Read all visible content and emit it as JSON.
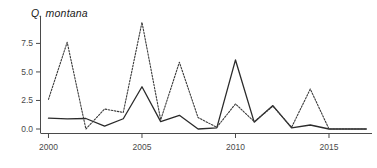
{
  "chart_data": {
    "type": "line",
    "title": "Q. montana",
    "xlabel": "",
    "ylabel": "",
    "x": [
      2000,
      2001,
      2002,
      2003,
      2004,
      2005,
      2006,
      2007,
      2008,
      2009,
      2010,
      2011,
      2012,
      2013,
      2014,
      2015,
      2016,
      2017
    ],
    "xlim": [
      1999.6,
      2017.3
    ],
    "ylim": [
      -0.35,
      9.9
    ],
    "xticks": [
      2000,
      2005,
      2010,
      2015
    ],
    "xtick_labels": [
      "2000",
      "2005",
      "2010",
      "2015"
    ],
    "yticks": [
      0.0,
      2.5,
      5.0,
      7.5
    ],
    "ytick_labels": [
      "0.0",
      "2.5",
      "5.0",
      "7.5"
    ],
    "grid": false,
    "legend": "none",
    "series": [
      {
        "name": "solid",
        "style": "solid",
        "color": "#2b2b2b",
        "values": [
          0.95,
          0.88,
          0.92,
          0.25,
          0.9,
          3.7,
          0.65,
          1.2,
          0.0,
          0.1,
          6.05,
          0.6,
          2.05,
          0.1,
          0.35,
          0.0,
          0.0,
          0.0
        ]
      },
      {
        "name": "dashed",
        "style": "dashed",
        "color": "#3a3a3a",
        "values": [
          2.6,
          7.6,
          0.0,
          1.75,
          1.45,
          9.35,
          0.8,
          5.85,
          1.0,
          0.15,
          2.2,
          0.65,
          2.0,
          0.15,
          3.5,
          0.0,
          0.0,
          0.0
        ]
      }
    ]
  }
}
